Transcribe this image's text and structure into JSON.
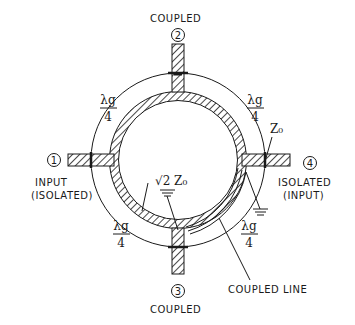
{
  "diagram": {
    "type": "branch-line coupler with coupled line",
    "ports": [
      {
        "id": "1",
        "number_label": "1",
        "name": "INPUT",
        "alt": "(ISOLATED)"
      },
      {
        "id": "2",
        "number_label": "2",
        "name": "COUPLED"
      },
      {
        "id": "3",
        "number_label": "3",
        "name": "COUPLED"
      },
      {
        "id": "4",
        "number_label": "4",
        "name": "ISOLATED",
        "alt": "(INPUT)"
      }
    ],
    "quarter_wave": {
      "numerator": "λg",
      "denominator": "4"
    },
    "impedance_ring": "√2 Z₀",
    "impedance_port": "Z₀",
    "coupled_line_label": "COUPLED LINE",
    "colors": {
      "ink": "#1a1a1a",
      "background": "#ffffff"
    }
  }
}
